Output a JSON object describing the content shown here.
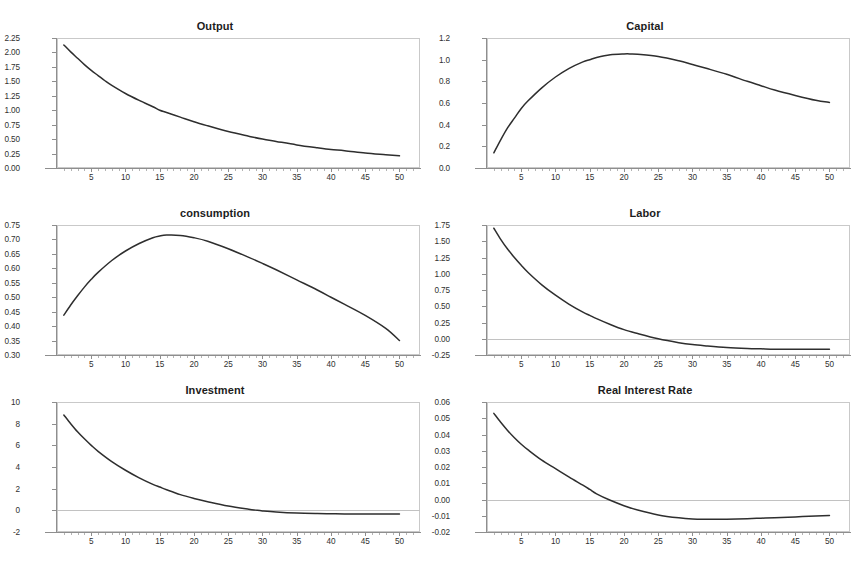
{
  "page": {
    "top_fragment_text": "",
    "background_color": "#ffffff",
    "line_color": "#2e2e2e",
    "frame_color": "#c9c9c9",
    "axis_color": "#8e8e8e"
  },
  "chart_data": [
    {
      "type": "line",
      "title": "Output",
      "xlabel": "",
      "ylabel": "",
      "grid": false,
      "legend": "none",
      "xlim": [
        0,
        53
      ],
      "ylim": [
        0.0,
        2.25
      ],
      "xticks": [
        5,
        10,
        15,
        20,
        25,
        30,
        35,
        40,
        45,
        50
      ],
      "yticks": [
        "0.00",
        "0.25",
        "0.50",
        "0.75",
        "1.00",
        "1.25",
        "1.50",
        "1.75",
        "2.00",
        "2.25"
      ],
      "x": [
        1,
        2,
        3,
        4,
        5,
        6,
        7,
        8,
        10,
        12,
        14,
        15,
        16,
        18,
        20,
        22,
        25,
        28,
        30,
        32,
        35,
        38,
        40,
        42,
        45,
        48,
        50
      ],
      "values": [
        2.13,
        2.01,
        1.9,
        1.79,
        1.69,
        1.6,
        1.51,
        1.43,
        1.29,
        1.17,
        1.06,
        1.0,
        0.96,
        0.88,
        0.8,
        0.73,
        0.63,
        0.55,
        0.5,
        0.46,
        0.4,
        0.35,
        0.32,
        0.3,
        0.26,
        0.23,
        0.21
      ]
    },
    {
      "type": "line",
      "title": "Capital",
      "xlabel": "",
      "ylabel": "",
      "grid": false,
      "legend": "none",
      "xlim": [
        0,
        53
      ],
      "ylim": [
        0.0,
        1.2
      ],
      "xticks": [
        5,
        10,
        15,
        20,
        25,
        30,
        35,
        40,
        45,
        50
      ],
      "yticks": [
        "0.0",
        "0.2",
        "0.4",
        "0.6",
        "0.8",
        "1.0",
        "1.2"
      ],
      "x": [
        1,
        2,
        3,
        4,
        5,
        6,
        8,
        10,
        12,
        14,
        15,
        16,
        18,
        20,
        21,
        22,
        25,
        28,
        30,
        32,
        35,
        38,
        40,
        42,
        45,
        48,
        50
      ],
      "values": [
        0.14,
        0.26,
        0.37,
        0.46,
        0.55,
        0.62,
        0.74,
        0.84,
        0.92,
        0.98,
        1.0,
        1.02,
        1.045,
        1.053,
        1.053,
        1.05,
        1.03,
        0.99,
        0.955,
        0.92,
        0.865,
        0.8,
        0.76,
        0.72,
        0.67,
        0.625,
        0.605
      ]
    },
    {
      "type": "line",
      "title": "consumption",
      "xlabel": "",
      "ylabel": "",
      "grid": false,
      "legend": "none",
      "xlim": [
        0,
        53
      ],
      "ylim": [
        0.3,
        0.75
      ],
      "xticks": [
        5,
        10,
        15,
        20,
        25,
        30,
        35,
        40,
        45,
        50
      ],
      "yticks": [
        "0.30",
        "0.35",
        "0.40",
        "0.45",
        "0.50",
        "0.55",
        "0.60",
        "0.65",
        "0.70",
        "0.75"
      ],
      "x": [
        1,
        2,
        3,
        4,
        5,
        6,
        8,
        10,
        12,
        14,
        15,
        16,
        18,
        20,
        22,
        25,
        28,
        30,
        32,
        35,
        38,
        40,
        42,
        45,
        48,
        50
      ],
      "values": [
        0.438,
        0.473,
        0.505,
        0.535,
        0.562,
        0.586,
        0.627,
        0.66,
        0.686,
        0.706,
        0.712,
        0.715,
        0.714,
        0.706,
        0.694,
        0.668,
        0.638,
        0.617,
        0.595,
        0.56,
        0.525,
        0.5,
        0.475,
        0.437,
        0.392,
        0.35
      ]
    },
    {
      "type": "line",
      "title": "Labor",
      "xlabel": "",
      "ylabel": "",
      "grid": false,
      "legend": "none",
      "xlim": [
        0,
        53
      ],
      "ylim": [
        -0.25,
        1.75
      ],
      "xticks": [
        5,
        10,
        15,
        20,
        25,
        30,
        35,
        40,
        45,
        50
      ],
      "yticks": [
        "-0.25",
        "0.00",
        "0.25",
        "0.50",
        "0.75",
        "1.00",
        "1.25",
        "1.50",
        "1.75"
      ],
      "zero_line": true,
      "x": [
        1,
        2,
        3,
        4,
        5,
        6,
        8,
        10,
        12,
        14,
        15,
        16,
        18,
        20,
        22,
        25,
        28,
        30,
        32,
        35,
        38,
        40,
        42,
        45,
        48,
        50
      ],
      "values": [
        1.7,
        1.53,
        1.38,
        1.25,
        1.13,
        1.02,
        0.83,
        0.67,
        0.53,
        0.41,
        0.36,
        0.31,
        0.22,
        0.14,
        0.08,
        0.0,
        -0.06,
        -0.09,
        -0.11,
        -0.135,
        -0.15,
        -0.155,
        -0.16,
        -0.163,
        -0.163,
        -0.16
      ]
    },
    {
      "type": "line",
      "title": "Investment",
      "xlabel": "",
      "ylabel": "",
      "grid": false,
      "legend": "none",
      "xlim": [
        0,
        53
      ],
      "ylim": [
        -2,
        10
      ],
      "xticks": [
        5,
        10,
        15,
        20,
        25,
        30,
        35,
        40,
        45,
        50
      ],
      "yticks": [
        "-2",
        "0",
        "2",
        "4",
        "6",
        "8",
        "10"
      ],
      "zero_line": true,
      "x": [
        1,
        2,
        3,
        4,
        5,
        6,
        8,
        10,
        12,
        14,
        15,
        16,
        18,
        20,
        22,
        25,
        28,
        29,
        30,
        32,
        35,
        38,
        40,
        42,
        45,
        48,
        50
      ],
      "values": [
        8.8,
        8.0,
        7.25,
        6.6,
        6.0,
        5.45,
        4.5,
        3.7,
        3.0,
        2.4,
        2.15,
        1.9,
        1.45,
        1.1,
        0.8,
        0.4,
        0.1,
        0.02,
        -0.05,
        -0.15,
        -0.25,
        -0.3,
        -0.32,
        -0.33,
        -0.34,
        -0.34,
        -0.33
      ]
    },
    {
      "type": "line",
      "title": "Real Interest Rate",
      "xlabel": "",
      "ylabel": "",
      "grid": false,
      "legend": "none",
      "xlim": [
        0,
        53
      ],
      "ylim": [
        -0.02,
        0.06
      ],
      "xticks": [
        5,
        10,
        15,
        20,
        25,
        30,
        35,
        40,
        45,
        50
      ],
      "yticks": [
        "-0.02",
        "-0.01",
        "0.00",
        "0.01",
        "0.02",
        "0.03",
        "0.04",
        "0.05",
        "0.06"
      ],
      "zero_line": true,
      "x": [
        1,
        2,
        3,
        4,
        5,
        6,
        8,
        10,
        12,
        14,
        15,
        16,
        18,
        20,
        22,
        25,
        28,
        30,
        32,
        33,
        35,
        38,
        40,
        42,
        45,
        48,
        50
      ],
      "values": [
        0.053,
        0.0475,
        0.0425,
        0.038,
        0.034,
        0.0305,
        0.0242,
        0.019,
        0.0138,
        0.0088,
        0.0062,
        0.0035,
        -0.0005,
        -0.0038,
        -0.0065,
        -0.0095,
        -0.0113,
        -0.012,
        -0.0122,
        -0.0122,
        -0.0121,
        -0.0118,
        -0.0115,
        -0.0112,
        -0.0107,
        -0.0101,
        -0.0098
      ]
    }
  ]
}
